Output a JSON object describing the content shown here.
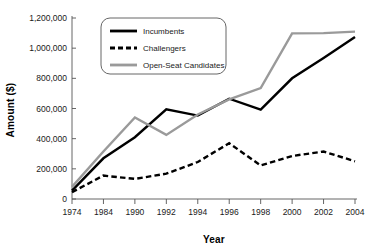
{
  "chart_data": {
    "type": "line",
    "title": "",
    "xlabel": "Year",
    "ylabel": "Amount ($)",
    "categories": [
      "1974",
      "1984",
      "1990",
      "1992",
      "1994",
      "1996",
      "1998",
      "2000",
      "2002",
      "2004"
    ],
    "series": [
      {
        "name": "Incumbents",
        "color": "#000000",
        "style": "solid",
        "values": [
          55000,
          270000,
          410000,
          595000,
          553000,
          665000,
          592000,
          800000,
          935000,
          1075000
        ]
      },
      {
        "name": "Challengers",
        "color": "#000000",
        "style": "dashed",
        "values": [
          45000,
          155000,
          133000,
          168000,
          245000,
          370000,
          222000,
          285000,
          315000,
          250000
        ]
      },
      {
        "name": "Open-Seat Candidates",
        "color": "#9a9a9a",
        "style": "solid",
        "values": [
          80000,
          315000,
          540000,
          425000,
          560000,
          660000,
          735000,
          1098000,
          1100000,
          1110000
        ]
      }
    ],
    "ylim": [
      0,
      1200000
    ],
    "yticks": [
      0,
      200000,
      400000,
      600000,
      800000,
      1000000,
      1200000
    ],
    "yticklabels": [
      "0",
      "200,000",
      "400,000",
      "600,000",
      "800,000",
      "1,000,000",
      "1,200,000"
    ],
    "grid": false,
    "legend_position": "top-center",
    "legend_entries": [
      "Incumbents",
      "Challengers",
      "Open-Seat Candidates"
    ]
  },
  "colors": {
    "incumbents": "#000000",
    "challengers": "#000000",
    "open_seat": "#9a9a9a",
    "axis": "#555555",
    "background": "#ffffff"
  }
}
